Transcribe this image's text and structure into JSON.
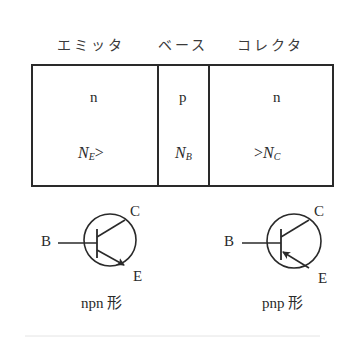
{
  "header": {
    "emitter": "エミッタ",
    "base": "ベース",
    "collector": "コレクタ"
  },
  "regions": [
    {
      "type": "n",
      "doping": "N",
      "doping_sub": "E",
      "relation_after": ">"
    },
    {
      "type": "p",
      "doping": "N",
      "doping_sub": "B"
    },
    {
      "type": "n",
      "doping": "N",
      "doping_sub": "C",
      "relation_before": ">"
    }
  ],
  "symbols": {
    "npn": {
      "base_label": "B",
      "collector_label": "C",
      "emitter_label": "E",
      "caption": "npn 形"
    },
    "pnp": {
      "base_label": "B",
      "collector_label": "C",
      "emitter_label": "E",
      "caption": "pnp 形"
    }
  },
  "colors": {
    "ink": "#2a2a2a",
    "background": "#ffffff"
  }
}
